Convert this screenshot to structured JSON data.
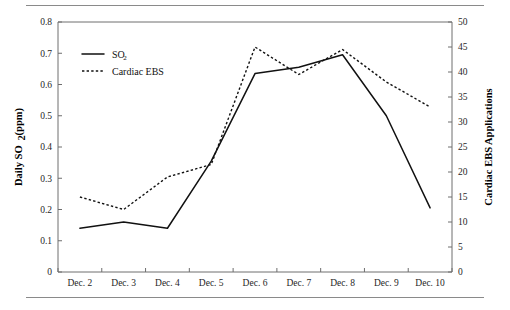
{
  "chart_data": {
    "type": "line",
    "title": "",
    "xlabel": "",
    "ylabel": "Daily SO2 (ppm)",
    "ylabel_main": "Daily SO",
    "ylabel_sub": "2",
    "ylabel_tail": " (ppm)",
    "y2label": "Cardiac EBS Applications",
    "categories": [
      "Dec. 2",
      "Dec. 3",
      "Dec. 4",
      "Dec. 5",
      "Dec. 6",
      "Dec. 7",
      "Dec. 8",
      "Dec. 9",
      "Dec. 10"
    ],
    "ylim": [
      0,
      0.8
    ],
    "y2lim": [
      0,
      50
    ],
    "yticks": [
      "0",
      "0.1",
      "0.2",
      "0.3",
      "0.4",
      "0.5",
      "0.6",
      "0.7",
      "0.8"
    ],
    "ytick_values": [
      0,
      0.1,
      0.2,
      0.3,
      0.4,
      0.5,
      0.6,
      0.7,
      0.8
    ],
    "y2ticks": [
      "0",
      "5",
      "10",
      "15",
      "20",
      "25",
      "30",
      "35",
      "40",
      "45",
      "50"
    ],
    "y2tick_values": [
      0,
      5,
      10,
      15,
      20,
      25,
      30,
      35,
      40,
      45,
      50
    ],
    "grid": false,
    "legend_position": "upper-left",
    "series": [
      {
        "name": "SO2",
        "label_main": "SO",
        "label_sub": "2",
        "style": "solid",
        "axis": "left",
        "units": "ppm",
        "values": [
          0.14,
          0.16,
          0.14,
          0.355,
          0.635,
          0.655,
          0.695,
          0.5,
          0.205
        ]
      },
      {
        "name": "Cardiac EBS",
        "label_main": "Cardiac EBS",
        "label_sub": "",
        "style": "dotted",
        "axis": "right",
        "units": "applications",
        "values": [
          15,
          12.5,
          19,
          21.5,
          45,
          39.5,
          44.5,
          38,
          33
        ]
      }
    ]
  },
  "legend": {
    "items": [
      {
        "label_main": "SO",
        "label_sub": "2",
        "style": "solid"
      },
      {
        "label_main": "Cardiac EBS",
        "label_sub": "",
        "style": "dotted"
      }
    ]
  }
}
